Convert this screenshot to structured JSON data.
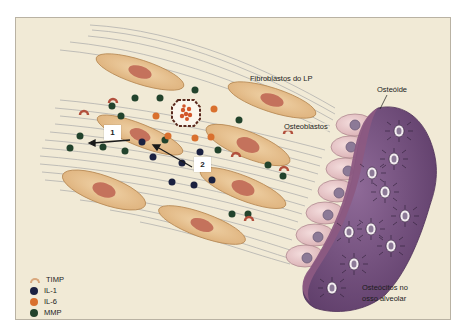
{
  "figure": {
    "labels": {
      "fibroblasts": "Fibroblastos do LP",
      "osteoid": "Osteóide",
      "osteoblasts": "Osteoblastos",
      "osteocytes_line1": "Osteócitos no",
      "osteocytes_line2": "osso alveolar"
    },
    "markers": {
      "one": "1",
      "two": "2"
    },
    "legend": [
      {
        "label": "TIMP",
        "shape": "arc",
        "color": "#d9a77c"
      },
      {
        "label": "IL-1",
        "shape": "dot",
        "color": "#1b2140"
      },
      {
        "label": "IL-6",
        "shape": "dot",
        "color": "#d9702e"
      },
      {
        "label": "MMP",
        "shape": "dot",
        "color": "#22432c"
      }
    ],
    "colors": {
      "background": "#f1ead6",
      "fibroblast_fill": "#e8c596",
      "fibroblast_nucleus": "#c4725c",
      "osteoblast_fill": "#e9c8cb",
      "osteoblast_nucleus": "#8c7a97",
      "bone_fill": "#7a5683",
      "osteoid_fill": "#8c5a82",
      "fiber_line": "#a8a8a8"
    }
  }
}
